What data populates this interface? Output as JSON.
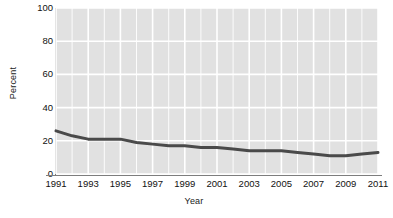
{
  "chart_data": {
    "type": "line",
    "title": "",
    "xlabel": "Year",
    "ylabel": "Percent",
    "x": [
      1991,
      1992,
      1993,
      1994,
      1995,
      1996,
      1997,
      1998,
      1999,
      2000,
      2001,
      2002,
      2003,
      2004,
      2005,
      2006,
      2007,
      2008,
      2009,
      2010,
      2011
    ],
    "values": [
      26,
      23,
      21,
      21,
      21,
      19,
      18,
      17,
      17,
      16,
      16,
      15,
      14,
      14,
      14,
      13,
      12,
      11,
      11,
      12,
      13
    ],
    "series": [
      {
        "name": "Percent",
        "values": [
          26,
          23,
          21,
          21,
          21,
          19,
          18,
          17,
          17,
          16,
          16,
          15,
          14,
          14,
          14,
          13,
          12,
          11,
          11,
          12,
          13
        ]
      }
    ],
    "xlim": [
      1991,
      2011
    ],
    "ylim": [
      0,
      100
    ],
    "ytick_values": [
      0,
      20,
      40,
      60,
      80,
      100
    ],
    "ytick_labels": [
      "0",
      "20",
      "40",
      "60",
      "80",
      "100"
    ],
    "xtick_values": [
      1991,
      1993,
      1995,
      1997,
      1999,
      2001,
      2003,
      2005,
      2007,
      2009,
      2011
    ],
    "xtick_labels": [
      "1991",
      "1993",
      "1995",
      "1997",
      "1999",
      "2001",
      "2003",
      "2005",
      "2007",
      "2009",
      "2011"
    ],
    "grid": true,
    "grid_color": "#ffffff",
    "panel_color": "#e1e1e1",
    "line_color": "#4a4a4a",
    "line_width": 3,
    "legend": false,
    "legend_position": "none"
  }
}
